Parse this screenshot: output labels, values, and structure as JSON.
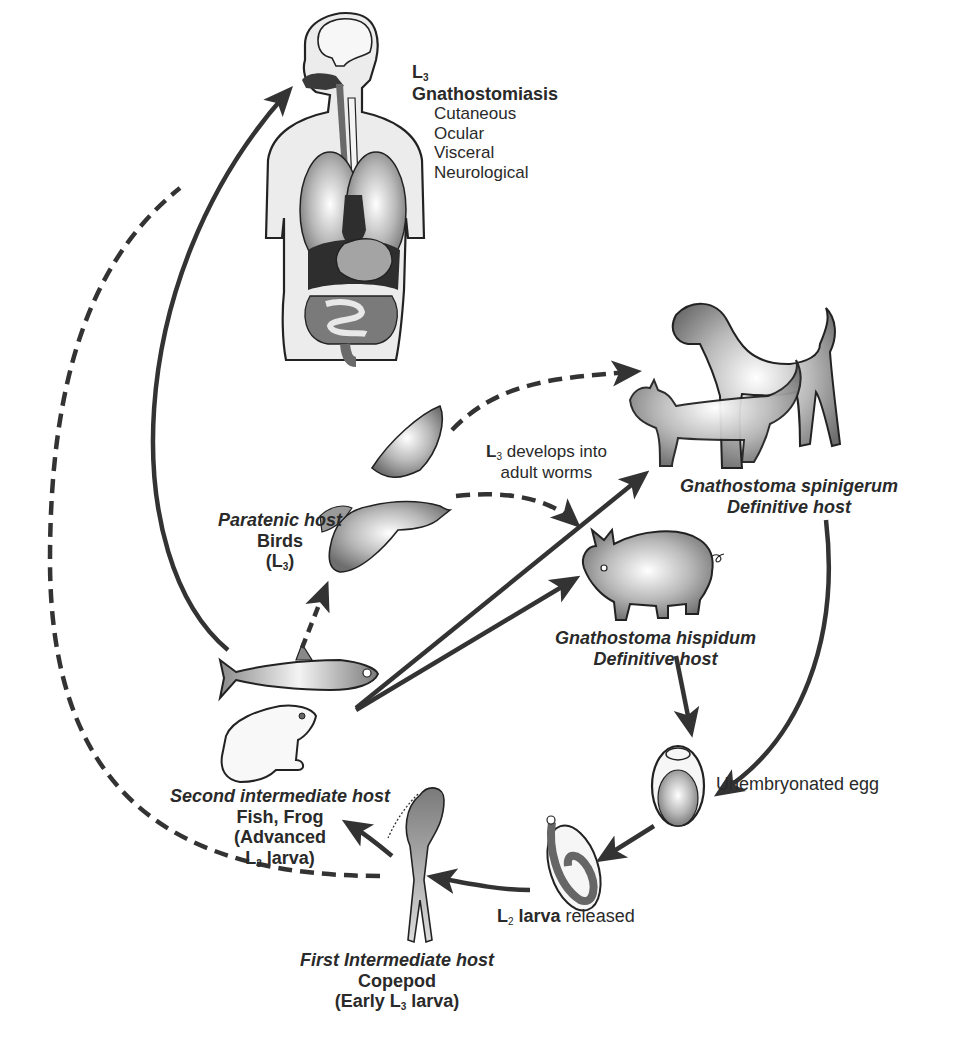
{
  "diagram": {
    "type": "life-cycle",
    "subject": "Gnathostoma"
  },
  "human": {
    "stage": "L",
    "stage_sub": "3",
    "disease": "Gnathostomiasis",
    "forms": [
      "Cutaneous",
      "Ocular",
      "Visceral",
      "Neurological"
    ]
  },
  "development_note": {
    "prefix": "L",
    "sub": "3",
    "line1_rest": " develops into",
    "line2": "adult worms"
  },
  "definitive_host_1": {
    "species": "Gnathostoma spinigerum",
    "role": "Definitive host"
  },
  "definitive_host_2": {
    "species": "Gnathostoma hispidum",
    "role": "Definitive host"
  },
  "paratenic_host": {
    "title": "Paratenic host",
    "animal": "Birds",
    "stage_open": "(L",
    "stage_sub": "3",
    "stage_close": ")"
  },
  "egg": {
    "label": "Unembryonated egg"
  },
  "l2": {
    "prefix": "L",
    "sub": "2",
    "bold": " larva",
    "rest": " released"
  },
  "first_intermediate": {
    "title": "First Intermediate host",
    "animal": "Copepod",
    "stage_open": "(Early L",
    "stage_sub": "3",
    "stage_close": " larva)"
  },
  "second_intermediate": {
    "title": "Second intermediate host",
    "animals": "Fish, Frog",
    "stage_line1": "(Advanced",
    "stage_prefix": "L",
    "stage_sub": "3",
    "stage_close": " larva)"
  },
  "colors": {
    "ink": "#2a2a2a",
    "arrow": "#333333",
    "fill_light": "#e6e6e6",
    "fill_mid": "#a8a8a8",
    "fill_dark": "#3a3a3a"
  }
}
